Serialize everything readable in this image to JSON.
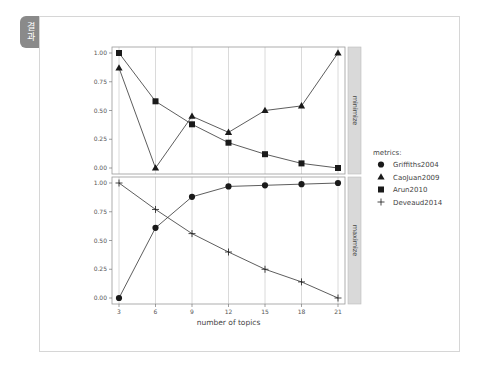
{
  "tag": {
    "label": "결과"
  },
  "chart_data": {
    "type": "line",
    "title": "",
    "xlabel": "number of topics",
    "ylabel": "",
    "x": [
      3,
      6,
      9,
      12,
      15,
      18,
      21
    ],
    "x_ticks": [
      "3",
      "6",
      "9",
      "12",
      "15",
      "18",
      "21"
    ],
    "y_ticks": [
      "0.00",
      "0.25",
      "0.50",
      "0.75",
      "1.00"
    ],
    "ylim": [
      0,
      1
    ],
    "grid": "vertical",
    "legend": {
      "title": "metrics:",
      "position": "right",
      "entries": [
        {
          "name": "Griffiths2004",
          "marker": "circle"
        },
        {
          "name": "CaoJuan2009",
          "marker": "triangle"
        },
        {
          "name": "Arun2010",
          "marker": "square"
        },
        {
          "name": "Deveaud2014",
          "marker": "plus"
        }
      ]
    },
    "panels": [
      {
        "facet": "minimize",
        "series": [
          {
            "name": "CaoJuan2009",
            "marker": "triangle",
            "values": [
              0.87,
              0.0,
              0.45,
              0.31,
              0.5,
              0.54,
              1.0
            ]
          },
          {
            "name": "Arun2010",
            "marker": "square",
            "values": [
              1.0,
              0.58,
              0.38,
              0.22,
              0.12,
              0.04,
              0.0
            ]
          }
        ]
      },
      {
        "facet": "maximize",
        "series": [
          {
            "name": "Griffiths2004",
            "marker": "circle",
            "values": [
              0.0,
              0.61,
              0.88,
              0.97,
              0.98,
              0.99,
              1.0
            ]
          },
          {
            "name": "Deveaud2014",
            "marker": "plus",
            "values": [
              1.0,
              0.77,
              0.56,
              0.4,
              0.25,
              0.14,
              0.0
            ]
          }
        ]
      }
    ]
  },
  "colors": {
    "line": "#333333",
    "marker": "#1a1a1a",
    "grid": "#d0d0d0",
    "strip_bg": "#d9d9d9",
    "panel_border": "#999999"
  }
}
